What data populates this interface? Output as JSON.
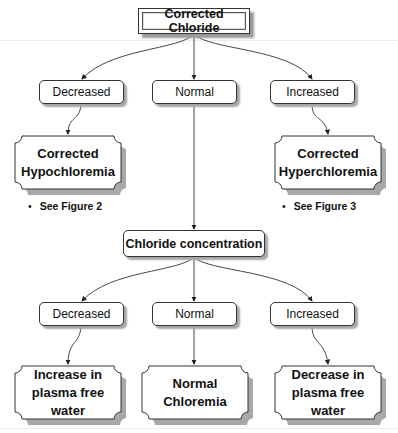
{
  "diagram": {
    "root": {
      "label": "Corrected Chloride"
    },
    "level1": [
      {
        "label": "Decreased"
      },
      {
        "label": "Normal"
      },
      {
        "label": "Increased"
      }
    ],
    "outcomes1": [
      {
        "label": "Corrected\nHypochloremia",
        "note": "See Figure 2"
      },
      {
        "label": "Corrected\nHyperchloremia",
        "note": "See Figure 3"
      }
    ],
    "middle": {
      "label": "Chloride concentration"
    },
    "level2": [
      {
        "label": "Decreased"
      },
      {
        "label": "Normal"
      },
      {
        "label": "Increased"
      }
    ],
    "outcomes2": [
      {
        "label": "Increase in\nplasma free\nwater"
      },
      {
        "label": "Normal\nChloremia"
      },
      {
        "label": "Decrease in\nplasma free\nwater"
      }
    ],
    "bullet": "•"
  }
}
